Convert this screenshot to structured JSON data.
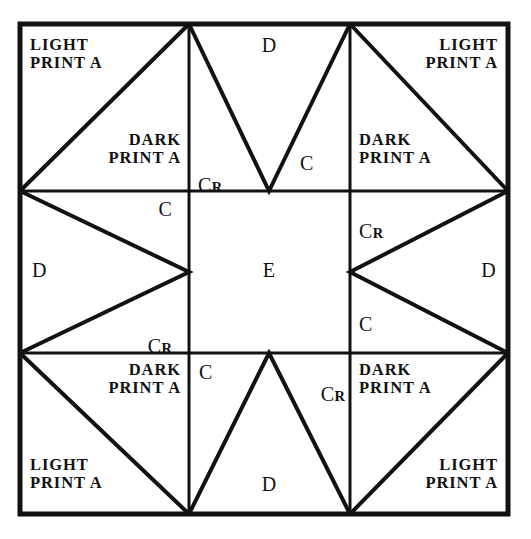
{
  "diagram": {
    "type": "quilt-block-layout",
    "grid": {
      "rows": 3,
      "columns": 3
    },
    "colors": {
      "background": "#ffffff",
      "line": "#121212",
      "text": "#111111"
    },
    "fabric_legend": {
      "light_print": "LIGHT\nPRINT A",
      "dark_print": "DARK\nPRINT A",
      "piece_c": "C",
      "piece_c_reversed_letter": "C",
      "piece_c_reversed_sub": "R",
      "piece_d": "D",
      "piece_e": "E"
    },
    "cells": [
      {
        "id": "top-left",
        "row": 0,
        "col": 0,
        "labels": [
          {
            "name": "light-print-a",
            "text": "LIGHT\nPRINT A",
            "style": "multi",
            "align": "left"
          },
          {
            "name": "dark-print-a",
            "text": "DARK\nPRINT A",
            "style": "multi",
            "align": "right"
          }
        ]
      },
      {
        "id": "top-center",
        "row": 0,
        "col": 1,
        "labels": [
          {
            "name": "piece-d",
            "text": "D",
            "style": "single",
            "align": "center"
          },
          {
            "name": "piece-c-reversed",
            "text": "C",
            "sub": "R",
            "style": "sub",
            "align": "left"
          },
          {
            "name": "piece-c",
            "text": "C",
            "style": "single",
            "align": "left"
          }
        ]
      },
      {
        "id": "top-right",
        "row": 0,
        "col": 2,
        "labels": [
          {
            "name": "light-print-a",
            "text": "LIGHT\nPRINT A",
            "style": "multi",
            "align": "right"
          },
          {
            "name": "dark-print-a",
            "text": "DARK\nPRINT A",
            "style": "multi",
            "align": "left"
          }
        ]
      },
      {
        "id": "middle-left",
        "row": 1,
        "col": 0,
        "labels": [
          {
            "name": "piece-c",
            "text": "C",
            "style": "single",
            "align": "right"
          },
          {
            "name": "piece-d",
            "text": "D",
            "style": "single",
            "align": "left"
          },
          {
            "name": "piece-c-reversed",
            "text": "C",
            "sub": "R",
            "style": "sub",
            "align": "right"
          }
        ]
      },
      {
        "id": "middle-center",
        "row": 1,
        "col": 1,
        "labels": [
          {
            "name": "piece-e",
            "text": "E",
            "style": "single",
            "align": "center"
          }
        ]
      },
      {
        "id": "middle-right",
        "row": 1,
        "col": 2,
        "labels": [
          {
            "name": "piece-c-reversed",
            "text": "C",
            "sub": "R",
            "style": "sub",
            "align": "left"
          },
          {
            "name": "piece-d",
            "text": "D",
            "style": "single",
            "align": "right"
          },
          {
            "name": "piece-c",
            "text": "C",
            "style": "single",
            "align": "left"
          }
        ]
      },
      {
        "id": "bottom-left",
        "row": 2,
        "col": 0,
        "labels": [
          {
            "name": "dark-print-a",
            "text": "DARK\nPRINT A",
            "style": "multi",
            "align": "right"
          },
          {
            "name": "light-print-a",
            "text": "LIGHT\nPRINT A",
            "style": "multi",
            "align": "left"
          }
        ]
      },
      {
        "id": "bottom-center",
        "row": 2,
        "col": 1,
        "labels": [
          {
            "name": "piece-c",
            "text": "C",
            "style": "single",
            "align": "left"
          },
          {
            "name": "piece-c-reversed",
            "text": "C",
            "sub": "R",
            "style": "sub",
            "align": "right"
          },
          {
            "name": "piece-d",
            "text": "D",
            "style": "single",
            "align": "center"
          }
        ]
      },
      {
        "id": "bottom-right",
        "row": 2,
        "col": 2,
        "labels": [
          {
            "name": "dark-print-a",
            "text": "DARK\nPRINT A",
            "style": "multi",
            "align": "left"
          },
          {
            "name": "light-print-a",
            "text": "LIGHT\nPRINT A",
            "style": "multi",
            "align": "right"
          }
        ]
      }
    ],
    "labels": {
      "tl_light": "LIGHT\nPRINT A",
      "tl_dark": "DARK\nPRINT A",
      "tc_d": "D",
      "tc_cr": "C",
      "tc_cr_sub": "R",
      "tc_c": "C",
      "tr_light": "LIGHT\nPRINT A",
      "tr_dark": "DARK\nPRINT A",
      "ml_c": "C",
      "ml_d": "D",
      "ml_cr": "C",
      "ml_cr_sub": "R",
      "mc_e": "E",
      "mr_cr": "C",
      "mr_cr_sub": "R",
      "mr_d": "D",
      "mr_c": "C",
      "bl_dark": "DARK\nPRINT A",
      "bl_light": "LIGHT\nPRINT A",
      "bc_c": "C",
      "bc_cr": "C",
      "bc_cr_sub": "R",
      "bc_d": "D",
      "br_dark": "DARK\nPRINT A",
      "br_light": "LIGHT\nPRINT A"
    }
  }
}
